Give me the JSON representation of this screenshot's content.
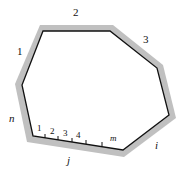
{
  "diagram": {
    "type": "polygon-with-shaded-border",
    "vertices": [
      [
        43,
        31
      ],
      [
        110,
        31
      ],
      [
        157,
        68
      ],
      [
        169,
        115
      ],
      [
        123,
        150
      ],
      [
        33,
        136
      ],
      [
        22,
        85
      ]
    ],
    "colors": {
      "edge": "#111111",
      "shade": "#b8b8b8"
    },
    "edge_labels": {
      "e1": "1",
      "e2": "2",
      "e3": "3",
      "e_i": "i",
      "e_j": "j",
      "e_n": "n"
    },
    "tick_labels": [
      "1",
      "2",
      "3",
      "4",
      "m"
    ]
  }
}
